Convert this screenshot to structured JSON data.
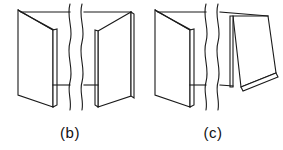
{
  "figure": {
    "background_color": "#ffffff",
    "line_color": "#1a1a1a",
    "face_fill": "#ffffff",
    "width": 283,
    "height": 150
  },
  "panels": [
    {
      "id": "b",
      "caption": "(b)",
      "description": "Two hinged flat panels opening symmetrically, joined at a central spine, with a wavy break line through the middle of the span",
      "left_leaf": {
        "name": "left-panel-face",
        "face_points": "18,10 53,30 53,107 18,95",
        "top_inner_points": "21,12 56,31 53,30 18,10",
        "spine_points": "53,30 57,29 57,105 53,107"
      },
      "right_leaf": {
        "name": "right-panel-face",
        "face_points": "98,31 131,12 131,96 98,107",
        "spine_points": "95,30 98,31 98,107 95,105",
        "edge_points": "131,12 134,14 134,98 131,96"
      },
      "connectors": [
        {
          "name": "top-connector-left",
          "d": "M21,12 L70,12"
        },
        {
          "name": "top-connector-right",
          "d": "M84,12 L131,12"
        },
        {
          "name": "bottom-connector-left",
          "d": "M53,85 L70,85"
        },
        {
          "name": "bottom-connector-right",
          "d": "M84,85 L98,85"
        }
      ],
      "break_lines": [
        {
          "name": "break-wave-left",
          "d": "M70,4 C66,18 74,28 70,42 C66,56 74,68 70,82 C67,92 72,100 70,110"
        },
        {
          "name": "break-wave-right",
          "d": "M82,4 C78,18 86,28 82,42 C78,56 86,68 82,82 C79,92 84,100 82,110"
        }
      ]
    },
    {
      "id": "c",
      "caption": "(c)",
      "description": "Two hinged panels where the right panel is folded outward nearly flat, sloping down to the right, joined at a central spine, with a wavy break line through the middle of the span",
      "left_leaf": {
        "name": "left-panel-face",
        "face_points": "155,10 190,30 190,107 155,95",
        "top_inner_points": "158,12 193,31 190,30 155,10",
        "spine_points": "190,30 194,29 194,105 190,107"
      },
      "right_leaf": {
        "name": "right-panel-face",
        "face_points": "233,16 268,16 276,73 241,87",
        "spine_points": "230,16 233,16 233,87 230,87",
        "edge_points": "241,87 276,73 278,77 243,91"
      },
      "connectors": [
        {
          "name": "top-connector-left",
          "d": "M158,12 L206,12"
        },
        {
          "name": "top-connector-right",
          "d": "M220,12 L268,16"
        },
        {
          "name": "bottom-connector-left",
          "d": "M190,85 L206,85"
        },
        {
          "name": "bottom-connector-right",
          "d": "M220,85 L233,86"
        }
      ],
      "break_lines": [
        {
          "name": "break-wave-left",
          "d": "M206,4 C202,18 210,28 206,42 C202,56 210,68 206,82 C203,92 208,100 206,110"
        },
        {
          "name": "break-wave-right",
          "d": "M218,4 C214,18 222,28 218,42 C214,56 222,68 218,82 C215,92 220,100 218,110"
        }
      ]
    }
  ],
  "captions": {
    "b": "(b)",
    "c": "(c)"
  }
}
